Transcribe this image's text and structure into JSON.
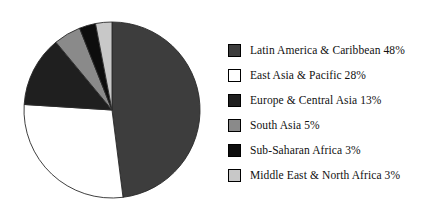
{
  "chart_data": {
    "type": "pie",
    "title": "",
    "subtitle": "",
    "xlabel": "",
    "ylabel": "",
    "grid": false,
    "legend_position": "right",
    "start_angle_deg": 0,
    "direction": "clockwise",
    "units": "percent",
    "total": 100,
    "categories": [
      "Latin America & Caribbean",
      "East Asia & Pacific",
      "Europe & Central Asia",
      "South Asia",
      "Sub-Saharan Africa",
      "Middle East & North Africa"
    ],
    "values": [
      48,
      28,
      13,
      5,
      3,
      3
    ],
    "colors": [
      "#3d3d3d",
      "#ffffff",
      "#1f1f1f",
      "#8a8a8a",
      "#0d0d0d",
      "#c8c8c8"
    ],
    "slices": [
      {
        "label": "Latin America & Caribbean",
        "value": 48,
        "legend_text": "Latin America & Caribbean 48%",
        "color": "#3d3d3d"
      },
      {
        "label": "East Asia & Pacific",
        "value": 28,
        "legend_text": "East Asia & Pacific 28%",
        "color": "#ffffff"
      },
      {
        "label": "Europe & Central Asia",
        "value": 13,
        "legend_text": "Europe & Central Asia 13%",
        "color": "#1f1f1f"
      },
      {
        "label": "South Asia",
        "value": 5,
        "legend_text": "South Asia 5%",
        "color": "#8a8a8a"
      },
      {
        "label": "Sub-Saharan Africa",
        "value": 3,
        "legend_text": "Sub-Saharan Africa 3%",
        "color": "#0d0d0d"
      },
      {
        "label": "Middle East & North Africa",
        "value": 3,
        "legend_text": "Middle East & North Africa 3%",
        "color": "#c8c8c8"
      }
    ]
  },
  "geometry": {
    "center_x": 112,
    "center_y": 110,
    "radius": 88,
    "stroke": "#2a2a2a",
    "stroke_width": 0.9
  },
  "legend": {
    "rows": [
      {
        "text": "Latin America & Caribbean 48%",
        "color": "#3d3d3d"
      },
      {
        "text": "East Asia & Pacific 28%",
        "color": "#ffffff"
      },
      {
        "text": "Europe & Central Asia 13%",
        "color": "#1f1f1f"
      },
      {
        "text": "South Asia 5%",
        "color": "#8a8a8a"
      },
      {
        "text": "Sub-Saharan Africa 3%",
        "color": "#0d0d0d"
      },
      {
        "text": "Middle East & North Africa 3%",
        "color": "#c8c8c8"
      }
    ]
  }
}
